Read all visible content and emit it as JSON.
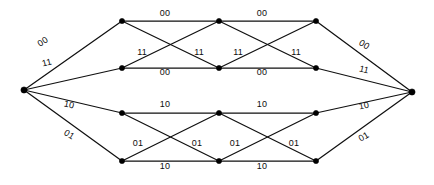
{
  "figure": {
    "name": "convolutional-code-trellis-diagram",
    "type": "trellis",
    "width": 434,
    "height": 185,
    "background_color": "#ffffff",
    "line_color": "#101010",
    "node_color": "#000000",
    "label_color": "#0d0d0d"
  },
  "nodes": [
    {
      "id": "start",
      "x": 24,
      "y": 90,
      "r": 3.1
    },
    {
      "id": "r1c1",
      "x": 122,
      "y": 21,
      "r": 2.6
    },
    {
      "id": "r1c2",
      "x": 219,
      "y": 21,
      "r": 2.6
    },
    {
      "id": "r1c3",
      "x": 316,
      "y": 21,
      "r": 2.6
    },
    {
      "id": "r2c1",
      "x": 122,
      "y": 68,
      "r": 2.6
    },
    {
      "id": "r2c2",
      "x": 219,
      "y": 68,
      "r": 2.6
    },
    {
      "id": "r2c3",
      "x": 316,
      "y": 68,
      "r": 2.6
    },
    {
      "id": "r3c1",
      "x": 122,
      "y": 113,
      "r": 2.6
    },
    {
      "id": "r3c2",
      "x": 219,
      "y": 113,
      "r": 2.6
    },
    {
      "id": "r3c3",
      "x": 316,
      "y": 113,
      "r": 2.6
    },
    {
      "id": "r4c1",
      "x": 122,
      "y": 161,
      "r": 2.6
    },
    {
      "id": "r4c2",
      "x": 219,
      "y": 161,
      "r": 2.6
    },
    {
      "id": "r4c3",
      "x": 316,
      "y": 161,
      "r": 2.6
    },
    {
      "id": "end",
      "x": 412,
      "y": 92,
      "r": 3.1
    }
  ],
  "edges": [
    {
      "from": "start",
      "to": "r1c1"
    },
    {
      "from": "start",
      "to": "r2c1"
    },
    {
      "from": "start",
      "to": "r3c1"
    },
    {
      "from": "start",
      "to": "r4c1"
    },
    {
      "from": "r1c1",
      "to": "r1c2"
    },
    {
      "from": "r1c2",
      "to": "r1c3"
    },
    {
      "from": "r2c1",
      "to": "r2c2"
    },
    {
      "from": "r2c2",
      "to": "r2c3"
    },
    {
      "from": "r1c1",
      "to": "r2c2"
    },
    {
      "from": "r2c1",
      "to": "r1c2"
    },
    {
      "from": "r1c2",
      "to": "r2c3"
    },
    {
      "from": "r2c2",
      "to": "r1c3"
    },
    {
      "from": "r3c1",
      "to": "r3c2"
    },
    {
      "from": "r3c2",
      "to": "r3c3"
    },
    {
      "from": "r4c1",
      "to": "r4c2"
    },
    {
      "from": "r4c2",
      "to": "r4c3"
    },
    {
      "from": "r3c1",
      "to": "r4c2"
    },
    {
      "from": "r4c1",
      "to": "r3c2"
    },
    {
      "from": "r3c2",
      "to": "r4c3"
    },
    {
      "from": "r4c2",
      "to": "r3c3"
    },
    {
      "from": "r1c3",
      "to": "end"
    },
    {
      "from": "r2c3",
      "to": "end"
    },
    {
      "from": "r3c3",
      "to": "end"
    },
    {
      "from": "r4c3",
      "to": "end"
    }
  ],
  "labels": [
    {
      "id": "lbl-start-top",
      "text": "00",
      "x": 43,
      "y": 42,
      "rotate": -34
    },
    {
      "id": "lbl-start-upmid",
      "text": "11",
      "x": 47,
      "y": 63,
      "rotate": -14
    },
    {
      "id": "lbl-start-lowmid",
      "text": "10",
      "x": 69,
      "y": 105,
      "rotate": 12
    },
    {
      "id": "lbl-start-bottom",
      "text": "01",
      "x": 69,
      "y": 135,
      "rotate": 32
    },
    {
      "id": "lbl-top-seg1",
      "text": "00",
      "x": 165,
      "y": 13,
      "rotate": 0
    },
    {
      "id": "lbl-top-seg2",
      "text": "00",
      "x": 262,
      "y": 13,
      "rotate": 0
    },
    {
      "id": "lbl-mid-cross-1",
      "text": "11",
      "x": 142,
      "y": 52,
      "rotate": 0
    },
    {
      "id": "lbl-mid-cross-2",
      "text": "11",
      "x": 199,
      "y": 52,
      "rotate": 0
    },
    {
      "id": "lbl-mid-cross-3",
      "text": "11",
      "x": 238,
      "y": 52,
      "rotate": 0
    },
    {
      "id": "lbl-mid-cross-4",
      "text": "11",
      "x": 296,
      "y": 52,
      "rotate": 0
    },
    {
      "id": "lbl-row2-seg1",
      "text": "00",
      "x": 165,
      "y": 72,
      "rotate": 0
    },
    {
      "id": "lbl-row2-seg2",
      "text": "00",
      "x": 262,
      "y": 72,
      "rotate": 0
    },
    {
      "id": "lbl-row3-seg1",
      "text": "10",
      "x": 165,
      "y": 104,
      "rotate": 0
    },
    {
      "id": "lbl-row3-seg2",
      "text": "10",
      "x": 262,
      "y": 104,
      "rotate": 0
    },
    {
      "id": "lbl-low-cross-1",
      "text": "01",
      "x": 138,
      "y": 143,
      "rotate": 0
    },
    {
      "id": "lbl-low-cross-2",
      "text": "01",
      "x": 197,
      "y": 143,
      "rotate": 0
    },
    {
      "id": "lbl-low-cross-3",
      "text": "01",
      "x": 235,
      "y": 143,
      "rotate": 0
    },
    {
      "id": "lbl-low-cross-4",
      "text": "01",
      "x": 294,
      "y": 143,
      "rotate": 0
    },
    {
      "id": "lbl-bottom-seg1",
      "text": "10",
      "x": 165,
      "y": 166,
      "rotate": 0
    },
    {
      "id": "lbl-bottom-seg2",
      "text": "10",
      "x": 262,
      "y": 166,
      "rotate": 0
    },
    {
      "id": "lbl-end-top",
      "text": "00",
      "x": 364,
      "y": 45,
      "rotate": 33
    },
    {
      "id": "lbl-end-upmid",
      "text": "11",
      "x": 364,
      "y": 70,
      "rotate": 14
    },
    {
      "id": "lbl-end-lowmid",
      "text": "10",
      "x": 364,
      "y": 106,
      "rotate": -12
    },
    {
      "id": "lbl-end-bottom",
      "text": "01",
      "x": 364,
      "y": 137,
      "rotate": -31
    }
  ]
}
